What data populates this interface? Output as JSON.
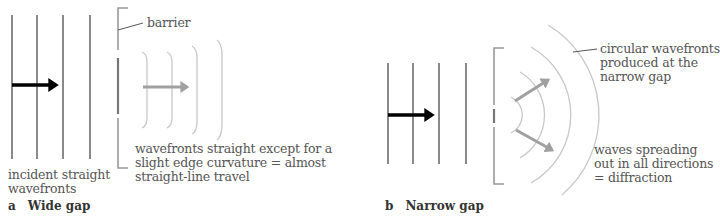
{
  "panel_a": {
    "caption_letter": "a",
    "caption_title": "Wide gap",
    "labels": {
      "barrier": "barrier",
      "incident_line1": "incident straight",
      "incident_line2": "wavefronts",
      "result_line1": "wavefronts straight except for a",
      "result_line2": "slight edge curvature = almost",
      "result_line3": "straight-line travel"
    }
  },
  "panel_b": {
    "caption_letter": "b",
    "caption_title": "Narrow gap",
    "labels": {
      "circular_line1": "circular wavefronts",
      "circular_line2": "produced at the",
      "circular_line3": "narrow gap",
      "spreading_line1": "waves spreading",
      "spreading_line2": "out in all directions",
      "spreading_line3": "= diffraction"
    }
  },
  "colors": {
    "incident_line": "#8a8a8a",
    "incident_arrow": "#000000",
    "diffracted_arrow": "#a0a0a0",
    "diffracted_wavefront": "#c8c8c8",
    "barrier": "#9a9a9a"
  }
}
